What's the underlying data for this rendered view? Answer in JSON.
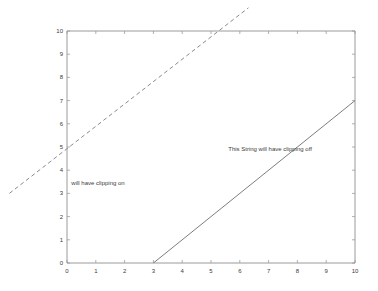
{
  "figure": {
    "background_color": "#ffffff",
    "axes_color": "#9a9a9a",
    "tick_color": "#3a3a3a",
    "width": 378,
    "height": 291
  },
  "chart_data": {
    "type": "line",
    "title": "",
    "xlabel": "",
    "ylabel": "",
    "xlim": [
      0,
      10
    ],
    "ylim": [
      0,
      10
    ],
    "xticks": [
      0,
      1,
      2,
      3,
      4,
      5,
      6,
      7,
      8,
      9,
      10
    ],
    "yticks": [
      0,
      1,
      2,
      3,
      4,
      5,
      6,
      7,
      8,
      9,
      10
    ],
    "xtick_labels": [
      "0",
      "1",
      "2",
      "3",
      "4",
      "5",
      "6",
      "7",
      "8",
      "9",
      "10"
    ],
    "ytick_labels": [
      "0",
      "1",
      "2",
      "3",
      "4",
      "5",
      "6",
      "7",
      "8",
      "9",
      "10"
    ],
    "grid": false,
    "legend": null,
    "series": [
      {
        "name": "dashed-line-clipping-off",
        "style": "dashed",
        "color": "#7d7d7d",
        "x": [
          -2.0,
          6.3
        ],
        "y": [
          3.0,
          11.0
        ],
        "clipped": false
      },
      {
        "name": "solid-line-clipping-on",
        "style": "solid",
        "color": "#6e6e6e",
        "x": [
          3.0,
          10.0
        ],
        "y": [
          0.0,
          7.0
        ],
        "clipped": true
      }
    ],
    "annotations": [
      {
        "name": "clipping-on-label",
        "text": "will have clipping on",
        "x": 0.15,
        "y": 3.45,
        "anchor": "start",
        "color": "#3c3c3c"
      },
      {
        "name": "clipping-off-label",
        "text": "This String will have clipping off",
        "x": 5.6,
        "y": 4.9,
        "anchor": "start",
        "color": "#3c3c3c"
      }
    ]
  }
}
